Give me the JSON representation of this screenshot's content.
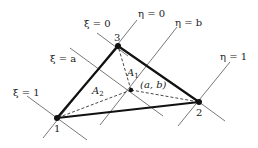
{
  "diagram": {
    "type": "triangle-area-coordinates",
    "colors": {
      "background": "#ffffff",
      "triangle_edge": "#111111",
      "grid_line": "#555555",
      "dashed_line": "#333333",
      "label": "#222222"
    },
    "nodes": [
      {
        "id": "1",
        "label": "1",
        "x": 57,
        "y": 118
      },
      {
        "id": "2",
        "label": "2",
        "x": 199,
        "y": 102
      },
      {
        "id": "3",
        "label": "3",
        "x": 118,
        "y": 46
      }
    ],
    "interior_point": {
      "label": "(a, b)",
      "x": 131,
      "y": 90
    },
    "area_labels": [
      {
        "id": "A1",
        "base": "A",
        "sub": "1"
      },
      {
        "id": "A2",
        "base": "A",
        "sub": "2"
      }
    ],
    "coordinate_lines": [
      {
        "id": "xi0",
        "label": "ξ = 0"
      },
      {
        "id": "xia",
        "label": "ξ = a"
      },
      {
        "id": "xi1",
        "label": "ξ = 1"
      },
      {
        "id": "eta0",
        "label": "η = 0"
      },
      {
        "id": "etab",
        "label": "η = b"
      },
      {
        "id": "eta1",
        "label": "η = 1"
      }
    ]
  }
}
